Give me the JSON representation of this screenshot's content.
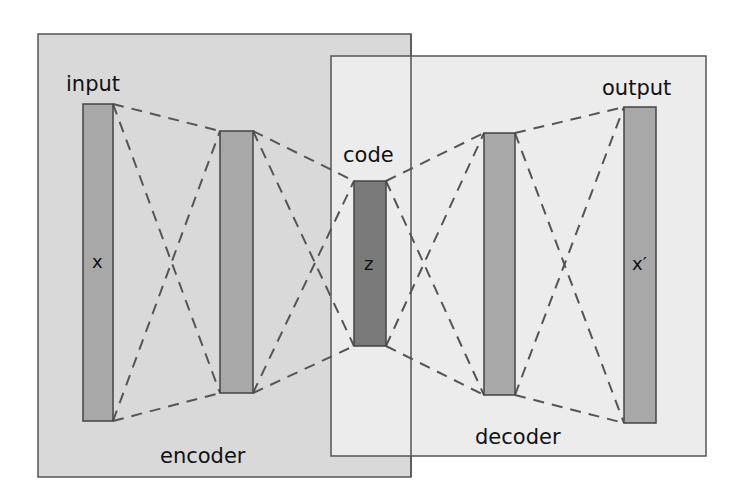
{
  "diagram": {
    "type": "autoencoder",
    "colors": {
      "encoder_box_fill": "#d9d9d9",
      "decoder_box_fill": "#ececec",
      "box_stroke": "#555555",
      "layer_fill": "#a8a8a8",
      "code_fill": "#7a7a7a",
      "dash_stroke": "#555555"
    },
    "boxes": {
      "encoder": {
        "label": "encoder",
        "x": 38,
        "y": 34,
        "w": 373,
        "h": 443
      },
      "decoder": {
        "label": "decoder",
        "x": 331,
        "y": 56,
        "w": 375,
        "h": 400
      }
    },
    "layers": [
      {
        "id": "input",
        "title": "input",
        "symbol": "x",
        "x": 83,
        "y": 104,
        "w": 30,
        "h": 317
      },
      {
        "id": "encoder-hidden",
        "title": "",
        "symbol": "",
        "x": 220,
        "y": 131,
        "w": 33,
        "h": 262
      },
      {
        "id": "code",
        "title": "code",
        "symbol": "z",
        "x": 354,
        "y": 181,
        "w": 32,
        "h": 165
      },
      {
        "id": "decoder-hidden",
        "title": "",
        "symbol": "",
        "x": 484,
        "y": 133,
        "w": 31,
        "h": 262
      },
      {
        "id": "output",
        "title": "output",
        "symbol": "x′",
        "x": 624,
        "y": 107,
        "w": 32,
        "h": 316
      }
    ],
    "labels": {
      "input": "input",
      "code": "code",
      "output": "output",
      "encoder": "encoder",
      "decoder": "decoder",
      "x": "x",
      "z": "z",
      "x_prime": "x′"
    }
  }
}
